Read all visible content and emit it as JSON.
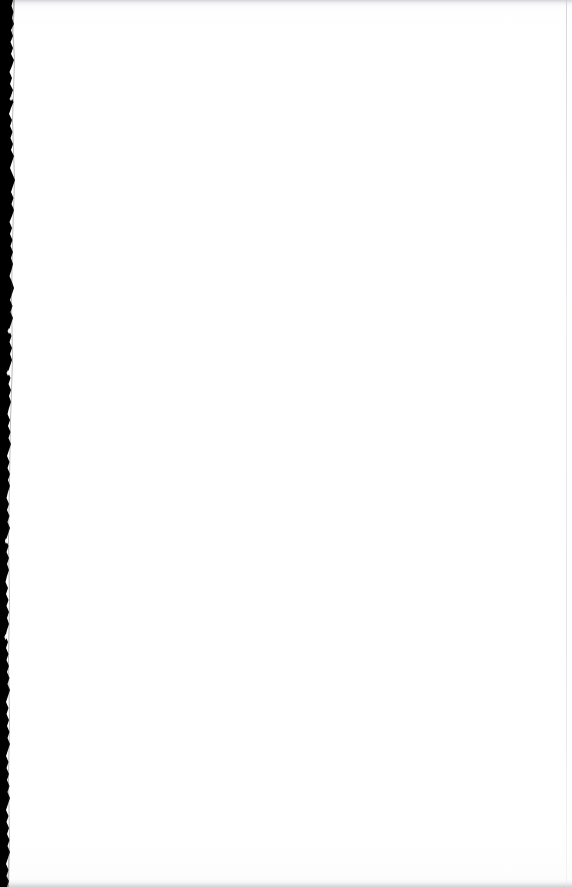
{
  "document": {
    "kind": "scanned-page",
    "title": "Scanned blank page",
    "page_content_text": "",
    "is_blank": true,
    "width_px": 572,
    "height_px": 887,
    "background_color": "#ffffff",
    "paper_color": "#fdfdfe"
  },
  "artifacts": {
    "left_edge": {
      "name": "binding-edge-shadow",
      "color": "#000000",
      "position": "left",
      "max_width_px": 16,
      "min_width_px": 5,
      "description": "Ragged black scanner edge / book gutter shadow"
    },
    "top_band": {
      "name": "top-scan-band",
      "color": "#9c9ea5",
      "height_px": 9
    },
    "bottom_band": {
      "name": "bottom-scan-band",
      "color": "#9698a0",
      "height_px": 10
    },
    "right_line": {
      "name": "page-edge-line",
      "color": "#cdcfd4",
      "x_px": 566,
      "width_px": 1
    }
  }
}
